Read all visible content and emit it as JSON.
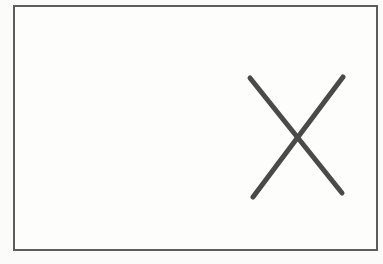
{
  "theme": {
    "page_background": "#fbfbf9",
    "frame_border_color": "#5c5c5c",
    "frame_background": "#fdfdfc",
    "x_mark_color": "#4a4a4a"
  },
  "figure": {
    "frame": {
      "shape": "rectangle-outline",
      "border_width": 2
    },
    "x_mark": {
      "icon": "x-mark-icon",
      "stroke_width": 5,
      "stroke_linecap": "round",
      "line1": {
        "x1": 250,
        "y1": 78,
        "x2": 342,
        "y2": 193
      },
      "line2": {
        "x1": 253,
        "y1": 197,
        "x2": 343,
        "y2": 77
      }
    }
  }
}
